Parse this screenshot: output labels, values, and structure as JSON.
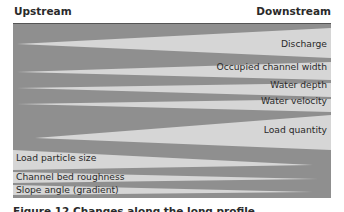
{
  "header": {
    "left": "Upstream",
    "right": "Downstream"
  },
  "colors": {
    "dark_band": "#8f8f8f",
    "light_wedge": "#d6d6d6",
    "text": "#2a2a2a"
  },
  "increasing_downstream": [
    {
      "label": "Discharge",
      "label_y": 44
    },
    {
      "label": "Occupied channel width",
      "label_y": 67
    },
    {
      "label": "Water depth",
      "label_y": 85
    },
    {
      "label": "Water velocity",
      "label_y": 100
    },
    {
      "label": "Load quantity",
      "label_y": 126
    }
  ],
  "decreasing_downstream": [
    {
      "label": "Load particle size",
      "label_y": 153
    },
    {
      "label": "Channel bed roughness",
      "label_y": 171
    },
    {
      "label": "Slope angle (gradient)",
      "label_y": 184
    }
  ],
  "caption": "Figure 12 Changes along the long profile"
}
